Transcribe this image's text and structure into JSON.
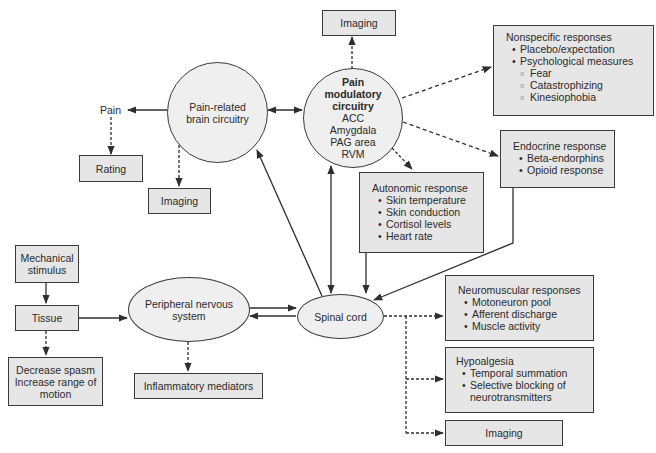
{
  "diagram": {
    "nodes": {
      "pain_related_brain": {
        "label": "Pain-related brain circuitry",
        "shape": "circle"
      },
      "pain_modulatory": {
        "title": "Pain modulatory circuitry",
        "items": [
          "ACC",
          "Amygdala",
          "PAG area",
          "RVM"
        ],
        "shape": "circle"
      },
      "peripheral_nervous": {
        "label": "Peripheral nervous system",
        "shape": "ellipse"
      },
      "spinal_cord": {
        "label": "Spinal cord",
        "shape": "ellipse"
      }
    },
    "pain_label": "Pain",
    "boxes": {
      "imaging_top": {
        "label": "Imaging"
      },
      "rating": {
        "label": "Rating"
      },
      "imaging_left": {
        "label": "Imaging"
      },
      "mechanical_stimulus": {
        "line1": "Mechanical",
        "line2": "stimulus"
      },
      "tissue": {
        "label": "Tissue"
      },
      "decrease": {
        "line1": "Decrease spasm",
        "line2": "Increase range of",
        "line3": "motion"
      },
      "inflammatory": {
        "label": "Inflammatory mediators"
      },
      "nonspecific": {
        "title": "Nonspecific responses",
        "items": [
          "Placebo/expectation",
          "Psychological measures"
        ],
        "subitems": [
          "Fear",
          "Catastrophizing",
          "Kinesiophobia"
        ]
      },
      "endocrine": {
        "title": "Endocrine response",
        "items": [
          "Beta-endorphins",
          "Opioid response"
        ]
      },
      "autonomic": {
        "title": "Autonomic response",
        "items": [
          "Skin temperature",
          "Skin conduction",
          "Cortisol levels",
          "Heart rate"
        ]
      },
      "neuromuscular": {
        "title": "Neuromuscular responses",
        "items": [
          "Motoneuron pool",
          "Afferent discharge",
          "Muscle activity"
        ]
      },
      "hypoalgesia": {
        "title": "Hypoalgesia",
        "items": [
          "Temporal summation",
          "Selective blocking of",
          "neurotransmitters"
        ]
      },
      "imaging_bottom": {
        "label": "Imaging"
      }
    },
    "colors": {
      "box_fill": "#e6e6e6",
      "node_fill": "#efefef",
      "stroke": "#2e2e2e"
    },
    "edges": [
      {
        "from": "Pain-related brain circuitry",
        "to": "Pain",
        "style": "solid"
      },
      {
        "from": "Pain",
        "to": "Rating",
        "style": "dashed"
      },
      {
        "from": "Pain-related brain circuitry",
        "to": "Imaging",
        "style": "dashed"
      },
      {
        "from": "Pain-related brain circuitry",
        "to": "Pain modulatory circuitry",
        "style": "solid-bidirectional"
      },
      {
        "from": "Pain modulatory circuitry",
        "to": "Imaging",
        "style": "dashed"
      },
      {
        "from": "Pain modulatory circuitry",
        "to": "Nonspecific responses",
        "style": "dashed"
      },
      {
        "from": "Pain modulatory circuitry",
        "to": "Endocrine response",
        "style": "dashed"
      },
      {
        "from": "Pain modulatory circuitry",
        "to": "Autonomic response",
        "style": "dashed"
      },
      {
        "from": "Spinal cord",
        "to": "Pain modulatory circuitry",
        "style": "solid-bidirectional"
      },
      {
        "from": "Spinal cord",
        "to": "Pain-related brain circuitry",
        "style": "solid"
      },
      {
        "from": "Autonomic response",
        "to": "Spinal cord",
        "style": "solid"
      },
      {
        "from": "Endocrine response",
        "to": "Spinal cord",
        "style": "solid"
      },
      {
        "from": "Mechanical stimulus",
        "to": "Tissue",
        "style": "solid"
      },
      {
        "from": "Tissue",
        "to": "Decrease spasm / Increase range of motion",
        "style": "dashed"
      },
      {
        "from": "Tissue",
        "to": "Peripheral nervous system",
        "style": "solid"
      },
      {
        "from": "Peripheral nervous system",
        "to": "Inflammatory mediators",
        "style": "dashed"
      },
      {
        "from": "Peripheral nervous system",
        "to": "Spinal cord",
        "style": "solid-bidirectional"
      },
      {
        "from": "Spinal cord",
        "to": "Neuromuscular responses",
        "style": "dashed"
      },
      {
        "from": "Spinal cord",
        "to": "Hypoalgesia",
        "style": "dashed"
      },
      {
        "from": "Spinal cord",
        "to": "Imaging",
        "style": "dashed"
      }
    ]
  }
}
